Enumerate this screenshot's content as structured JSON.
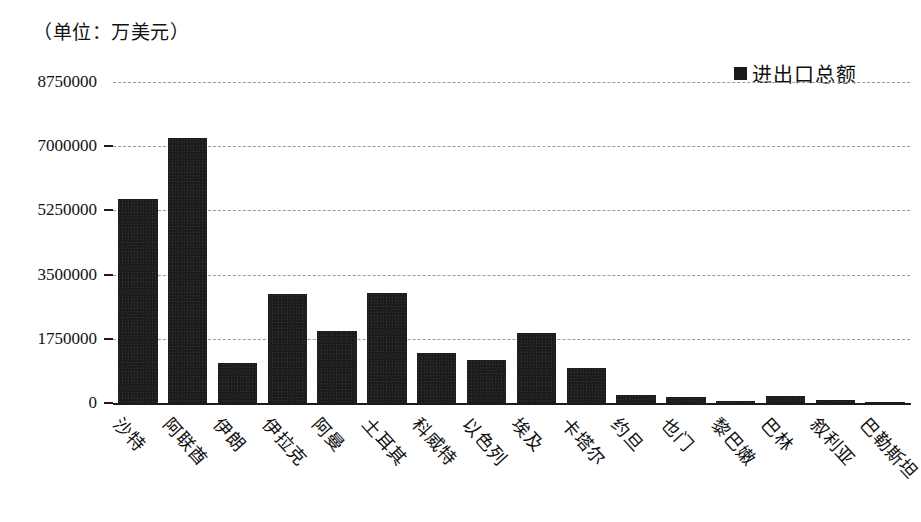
{
  "caption": {
    "unit_text": "（单位：万美元）"
  },
  "legend": {
    "position": "top-right",
    "marker_shape": "square",
    "marker_color": "#1a1a1a",
    "entries": [
      {
        "label": "进出口总额"
      }
    ]
  },
  "chart_data": {
    "type": "bar",
    "title": "",
    "subtitle": "",
    "unit": "万美元",
    "xlabel": "",
    "ylabel": "",
    "grid": true,
    "legend_position": "top-right",
    "ylim": [
      0,
      8750000
    ],
    "yticks": [
      0,
      1750000,
      3500000,
      5250000,
      7000000,
      8750000
    ],
    "ytick_labels": [
      "0",
      "1750000",
      "3500000",
      "5250000",
      "7000000",
      "8750000"
    ],
    "bar_color": "#1c1c1c",
    "categories": [
      "沙特",
      "阿联酋",
      "伊朗",
      "伊拉克",
      "阿曼",
      "土耳其",
      "科威特",
      "以色列",
      "埃及",
      "卡塔尔",
      "约旦",
      "也门",
      "黎巴嫩",
      "巴林",
      "叙利亚",
      "巴勒斯坦"
    ],
    "series": [
      {
        "name": "进出口总额",
        "values": [
          5560000,
          7220000,
          1090000,
          2970000,
          1960000,
          3000000,
          1360000,
          1170000,
          1910000,
          950000,
          215000,
          160000,
          55000,
          190000,
          80000,
          40000
        ]
      }
    ]
  }
}
